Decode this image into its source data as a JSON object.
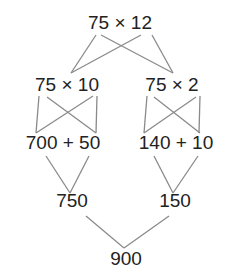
{
  "diagram": {
    "nodes": {
      "root": {
        "label": "75 × 12",
        "x": 120,
        "y": 13
      },
      "left_factor": {
        "label": "75 × 10",
        "x": 67,
        "y": 75
      },
      "right_factor": {
        "label": "75 × 2",
        "x": 172,
        "y": 75
      },
      "left_sum": {
        "label": "700 + 50",
        "x": 63,
        "y": 133
      },
      "right_sum": {
        "label": "140 + 10",
        "x": 176,
        "y": 133
      },
      "left_total": {
        "label": "750",
        "x": 72,
        "y": 191
      },
      "right_total": {
        "label": "150",
        "x": 175,
        "y": 191
      },
      "final": {
        "label": "900",
        "x": 126,
        "y": 249
      }
    },
    "edges": [
      {
        "from": "root",
        "to": "left_factor",
        "x1": 96,
        "y1": 35,
        "x2": 71,
        "y2": 73
      },
      {
        "from": "root",
        "to": "right_factor",
        "x1": 101,
        "y1": 35,
        "x2": 173,
        "y2": 73
      },
      {
        "from": "root",
        "to": "left_factor",
        "x1": 141,
        "y1": 35,
        "x2": 71,
        "y2": 73
      },
      {
        "from": "root",
        "to": "right_factor",
        "x1": 152,
        "y1": 35,
        "x2": 173,
        "y2": 73
      },
      {
        "from": "left_factor",
        "to": "left_sum",
        "x1": 39,
        "y1": 96,
        "x2": 36,
        "y2": 133
      },
      {
        "from": "left_factor",
        "to": "left_sum",
        "x1": 47,
        "y1": 97,
        "x2": 96,
        "y2": 133
      },
      {
        "from": "left_factor",
        "to": "left_sum",
        "x1": 93,
        "y1": 96,
        "x2": 36,
        "y2": 133
      },
      {
        "from": "left_factor",
        "to": "left_sum",
        "x1": 97,
        "y1": 96,
        "x2": 96,
        "y2": 133
      },
      {
        "from": "right_factor",
        "to": "right_sum",
        "x1": 147,
        "y1": 96,
        "x2": 144,
        "y2": 133
      },
      {
        "from": "right_factor",
        "to": "right_sum",
        "x1": 154,
        "y1": 97,
        "x2": 200,
        "y2": 133
      },
      {
        "from": "right_factor",
        "to": "right_sum",
        "x1": 196,
        "y1": 97,
        "x2": 144,
        "y2": 133
      },
      {
        "from": "right_factor",
        "to": "right_sum",
        "x1": 200,
        "y1": 96,
        "x2": 199,
        "y2": 133
      },
      {
        "from": "left_sum",
        "to": "left_total",
        "x1": 46,
        "y1": 156,
        "x2": 70,
        "y2": 193
      },
      {
        "from": "left_sum",
        "to": "left_total",
        "x1": 89,
        "y1": 156,
        "x2": 70,
        "y2": 193
      },
      {
        "from": "right_sum",
        "to": "right_total",
        "x1": 154,
        "y1": 156,
        "x2": 173,
        "y2": 193
      },
      {
        "from": "right_sum",
        "to": "right_total",
        "x1": 198,
        "y1": 156,
        "x2": 173,
        "y2": 193
      },
      {
        "from": "left_total",
        "to": "final",
        "x1": 86,
        "y1": 216,
        "x2": 124,
        "y2": 248
      },
      {
        "from": "right_total",
        "to": "final",
        "x1": 169,
        "y1": 216,
        "x2": 124,
        "y2": 248
      }
    ],
    "colors": {
      "text": "#222222",
      "line": "#8a8a8a",
      "background": "#ffffff"
    }
  }
}
